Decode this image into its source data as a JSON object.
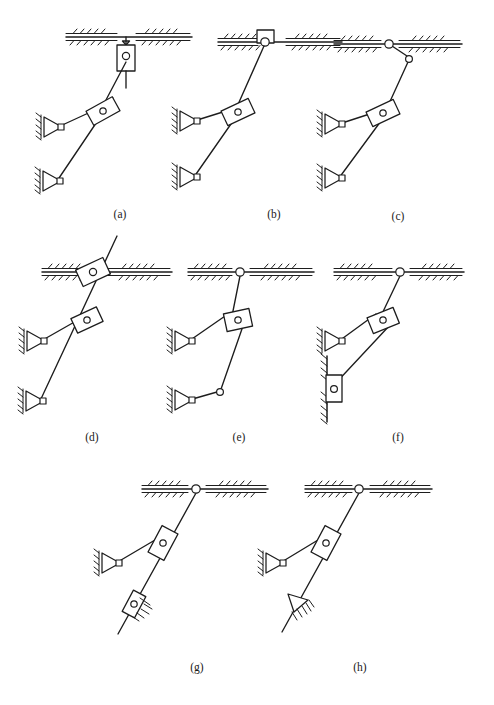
{
  "sheet": {
    "title": "Kinematic chain variants with sliding and turning pairs",
    "width": 494,
    "height": 705,
    "background_color": "#ffffff",
    "ink_color": "#1d1d1d"
  },
  "captions": [
    {
      "id": "a",
      "label": "(a)",
      "x": 120,
      "y": 214
    },
    {
      "id": "b",
      "label": "(b)",
      "x": 274,
      "y": 214
    },
    {
      "id": "c",
      "label": "(c)",
      "x": 398,
      "y": 216
    },
    {
      "id": "d",
      "label": "(d)",
      "x": 92,
      "y": 437
    },
    {
      "id": "e",
      "label": "(e)",
      "x": 239,
      "y": 437
    },
    {
      "id": "f",
      "label": "(f)",
      "x": 398,
      "y": 437
    },
    {
      "id": "g",
      "label": "(g)",
      "x": 197,
      "y": 667
    },
    {
      "id": "h",
      "label": "(h)",
      "x": 360,
      "y": 667
    }
  ],
  "figures": [
    {
      "id": "a",
      "caption": "(a)",
      "description": "Top slider block suspended below the horizontal ground line on a short vertical stem; long coupler down to a floating slider block, with two fixed pin joints at left.",
      "ground": {
        "type": "horizontal",
        "x1": 66,
        "x2": 192,
        "y": 37,
        "gap_x1": 118,
        "gap_x2": 133
      },
      "top_joint": {
        "type": "slider-below-ground",
        "x": 126,
        "y": 56
      },
      "mid_slider": {
        "type": "floating-slider-block",
        "x": 103,
        "y": 111
      },
      "fixed_pivots": [
        {
          "type": "pin-triangle-left",
          "x": 51,
          "y": 127
        },
        {
          "type": "pin-triangle-left",
          "x": 50,
          "y": 181
        }
      ]
    },
    {
      "id": "b",
      "caption": "(b)",
      "description": "Top pin joint carrying a block resting on top of the ground line; long coupler down to a floating slider block, with two fixed pin joints at left.",
      "ground": {
        "type": "horizontal",
        "x1": 218,
        "x2": 342,
        "y": 42,
        "gap_x1": 262,
        "gap_x2": 282
      },
      "top_joint": {
        "type": "block-on-ground-with-pin",
        "x": 265,
        "y": 42
      },
      "mid_slider": {
        "type": "floating-slider-block",
        "x": 238,
        "y": 112
      },
      "fixed_pivots": [
        {
          "type": "pin-triangle-left",
          "x": 186,
          "y": 121
        },
        {
          "type": "pin-triangle-left",
          "x": 186,
          "y": 177
        }
      ]
    },
    {
      "id": "c",
      "caption": "(c)",
      "description": "Fixed pin on the ground line, short link down-right to a free pin, then long coupler through a floating slider block to two fixed pin joints at left.",
      "ground": {
        "type": "horizontal",
        "x1": 334,
        "x2": 462,
        "y": 44,
        "gap_x1": 382,
        "gap_x2": 396
      },
      "top_joint": {
        "type": "pin-on-ground",
        "x": 389,
        "y": 44
      },
      "second_pin": {
        "type": "free-pin",
        "x": 409,
        "y": 59
      },
      "mid_slider": {
        "type": "floating-slider-block",
        "x": 383,
        "y": 113
      },
      "fixed_pivots": [
        {
          "type": "pin-triangle-left",
          "x": 331,
          "y": 124
        },
        {
          "type": "pin-triangle-left",
          "x": 331,
          "y": 178
        }
      ]
    },
    {
      "id": "d",
      "caption": "(d)",
      "description": "Slider block riding on the horizontal ground line with the rod passing through and extending above it; floating slider block below, two fixed pin joints at left.",
      "ground": {
        "type": "horizontal",
        "x1": 42,
        "x2": 172,
        "y": 272,
        "gap_x1": 83,
        "gap_x2": 104
      },
      "top_joint": {
        "type": "slider-on-ground-through-rod",
        "x": 93,
        "y": 272
      },
      "rod_tip_above": {
        "x": 117,
        "y": 236
      },
      "mid_slider": {
        "type": "floating-slider-block",
        "x": 87,
        "y": 320
      },
      "fixed_pivots": [
        {
          "type": "pin-triangle-left",
          "x": 33,
          "y": 341
        },
        {
          "type": "pin-triangle-left",
          "x": 32,
          "y": 401
        }
      ]
    },
    {
      "id": "e",
      "caption": "(e)",
      "description": "Pin joint on the ground line, rod down through a floating slider block to a free pin, then a link left to a lower fixed pin joint.",
      "ground": {
        "type": "horizontal",
        "x1": 188,
        "x2": 314,
        "y": 272,
        "gap_x1": 232,
        "gap_x2": 248
      },
      "top_joint": {
        "type": "pin-on-ground",
        "x": 240,
        "y": 272
      },
      "mid_slider": {
        "type": "floating-slider-block",
        "x": 238,
        "y": 320
      },
      "lower_free_pin": {
        "x": 220,
        "y": 392
      },
      "fixed_pivots": [
        {
          "type": "pin-triangle-left",
          "x": 181,
          "y": 341
        },
        {
          "type": "pin-triangle-left",
          "x": 181,
          "y": 400
        }
      ]
    },
    {
      "id": "f",
      "caption": "(f)",
      "description": "Pin joint on the ground line, rod down through a floating slider block to a slider block riding on a vertical hatched wall at the lower left.",
      "ground": {
        "type": "horizontal",
        "x1": 334,
        "x2": 464,
        "y": 272,
        "gap_x1": 392,
        "gap_x2": 408
      },
      "top_joint": {
        "type": "pin-on-ground",
        "x": 400,
        "y": 272
      },
      "mid_slider": {
        "type": "floating-slider-block",
        "x": 383,
        "y": 320
      },
      "wall": {
        "type": "vertical-wall",
        "x": 327,
        "y1": 354,
        "y2": 420
      },
      "wall_slider": {
        "type": "slider-on-vertical-wall",
        "x": 332,
        "y": 390
      },
      "fixed_pivots": [
        {
          "type": "pin-triangle-left",
          "x": 331,
          "y": 341
        }
      ]
    },
    {
      "id": "g",
      "caption": "(g)",
      "description": "Pin joint on the ground line, long rod down through a floating slider block to an inclined slider block with hatching, rod continuing past it.",
      "ground": {
        "type": "horizontal",
        "x1": 142,
        "x2": 268,
        "y": 489,
        "gap_x1": 188,
        "gap_x2": 204
      },
      "top_joint": {
        "type": "pin-on-ground",
        "x": 196,
        "y": 489
      },
      "mid_slider": {
        "type": "floating-slider-block",
        "x": 163,
        "y": 543
      },
      "incline_slider": {
        "type": "inclined-slider-with-hatching",
        "x": 134,
        "y": 604
      },
      "rod_tip": {
        "x": 118,
        "y": 634
      },
      "fixed_pivots": [
        {
          "type": "pin-triangle-left",
          "x": 108,
          "y": 563
        }
      ]
    },
    {
      "id": "h",
      "caption": "(h)",
      "description": "Pin joint on the ground line, long rod down through a floating slider block to a knife-edge triangular contact with hatching, rod continuing past it.",
      "ground": {
        "type": "horizontal",
        "x1": 305,
        "x2": 432,
        "y": 489,
        "gap_x1": 352,
        "gap_x2": 368
      },
      "top_joint": {
        "type": "pin-on-ground",
        "x": 359,
        "y": 489
      },
      "mid_slider": {
        "type": "floating-slider-block",
        "x": 326,
        "y": 543
      },
      "knife_edge": {
        "type": "triangle-knife-edge-with-hatching",
        "x": 298,
        "y": 602
      },
      "rod_tip": {
        "x": 282,
        "y": 632
      },
      "fixed_pivots": [
        {
          "type": "pin-triangle-left",
          "x": 272,
          "y": 563
        }
      ]
    }
  ],
  "legend": {
    "symbols": [
      {
        "name": "ground-hatching",
        "meaning": "fixed frame / ground"
      },
      {
        "name": "fixed-pin-triangle",
        "meaning": "fixed revolute joint"
      },
      {
        "name": "slider-block",
        "meaning": "prismatic (sliding) pair"
      },
      {
        "name": "open-circle-pin",
        "meaning": "turning pair / revolute joint"
      }
    ]
  }
}
